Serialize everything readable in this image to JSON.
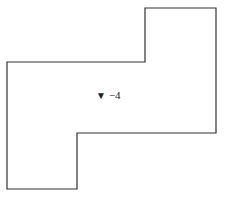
{
  "diagram": {
    "type": "floor-plan-outline",
    "shape": {
      "points": [
        [
          7,
          62
        ],
        [
          145,
          62
        ],
        [
          145,
          8
        ],
        [
          216,
          8
        ],
        [
          216,
          133
        ],
        [
          77,
          133
        ],
        [
          77,
          189
        ],
        [
          7,
          189
        ]
      ],
      "stroke": "#333333",
      "stroke_width": 1.2,
      "fill": "#ffffff"
    },
    "marker": {
      "symbol": "▼",
      "text": "−4"
    }
  }
}
